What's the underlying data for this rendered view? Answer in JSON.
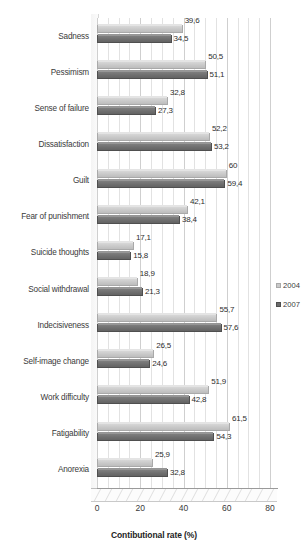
{
  "chart_data": {
    "type": "bar",
    "orientation": "horizontal",
    "title": "",
    "xlabel": "Contibutional rate (%)",
    "ylabel": "",
    "xlim": [
      0,
      80
    ],
    "xticks": [
      0,
      20,
      40,
      60,
      80
    ],
    "grid": true,
    "legend_position": "right",
    "categories": [
      "Sadness",
      "Pessimism",
      "Sense of failure",
      "Dissatisfaction",
      "Guilt",
      "Fear of punishment",
      "Suicide thoughts",
      "Social withdrawal",
      "Indecisiveness",
      "Self-image change",
      "Work difficulty",
      "Fatigability",
      "Anorexia"
    ],
    "series": [
      {
        "name": "2004",
        "color": "#c8c8c8",
        "values": [
          39.6,
          50.5,
          32.8,
          52.2,
          60,
          42.1,
          17.1,
          18.9,
          55.7,
          26.5,
          51.9,
          61.5,
          25.9
        ],
        "labels": [
          "39,6",
          "50,5",
          "32,8",
          "52,2",
          "60",
          "42,1",
          "17,1",
          "18,9",
          "55,7",
          "26,5",
          "51,9",
          "61,5",
          "25,9"
        ]
      },
      {
        "name": "2007",
        "color": "#6e6e6e",
        "values": [
          34.5,
          51.1,
          27.3,
          53.2,
          59.4,
          38.4,
          15.8,
          21.3,
          57.6,
          24.6,
          42.8,
          54.3,
          32.8
        ],
        "labels": [
          "34,5",
          "51,1",
          "27,3",
          "53,2",
          "59,4",
          "38,4",
          "15,8",
          "21,3",
          "57,6",
          "24,6",
          "42,8",
          "54,3",
          "32,8"
        ]
      }
    ]
  },
  "legend": {
    "items": [
      {
        "label": "2004"
      },
      {
        "label": "2007"
      }
    ]
  }
}
